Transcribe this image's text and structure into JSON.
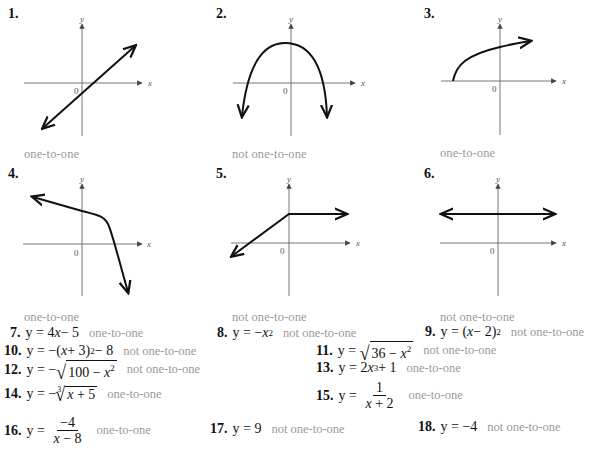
{
  "graphs": [
    {
      "number": "1.",
      "answer": "one-to-one",
      "curve": "line-increasing"
    },
    {
      "number": "2.",
      "answer": "not one-to-one",
      "curve": "downward-parabola"
    },
    {
      "number": "3.",
      "answer": "one-to-one",
      "curve": "square-root"
    },
    {
      "number": "4.",
      "answer": "one-to-one",
      "curve": "decreasing-bend"
    },
    {
      "number": "5.",
      "answer": "not one-to-one",
      "curve": "ramp-then-flat"
    },
    {
      "number": "6.",
      "answer": "not one-to-one",
      "curve": "horizontal-line"
    }
  ],
  "axes": {
    "x_label": "x",
    "y_label": "y",
    "origin_label": "0"
  },
  "equations": [
    {
      "number": "7.",
      "lhs": "y =",
      "expr": "4x − 5",
      "answer": "one-to-one"
    },
    {
      "number": "8.",
      "lhs": "y =",
      "expr": "−x²",
      "answer": "not one-to-one"
    },
    {
      "number": "9.",
      "lhs": "y =",
      "expr": "(x − 2)²",
      "answer": "not one-to-one"
    },
    {
      "number": "10.",
      "lhs": "y =",
      "expr": "−(x + 3)² − 8",
      "answer": "not one-to-one"
    },
    {
      "number": "11.",
      "lhs": "y =",
      "expr": "√(36 − x²)",
      "answer": "not one-to-one"
    },
    {
      "number": "12.",
      "lhs": "y =",
      "expr": "−√(100 − x²)",
      "answer": "not one-to-one"
    },
    {
      "number": "13.",
      "lhs": "y =",
      "expr": "2x³ + 1",
      "answer": "one-to-one"
    },
    {
      "number": "14.",
      "lhs": "y =",
      "expr": "−∛(x + 5)",
      "answer": "one-to-one"
    },
    {
      "number": "15.",
      "lhs": "y =",
      "expr": "1/(x + 2)",
      "answer": "one-to-one"
    },
    {
      "number": "16.",
      "lhs": "y =",
      "expr": "−4/(x − 8)",
      "answer": "one-to-one"
    },
    {
      "number": "17.",
      "lhs": "y =",
      "expr": "9",
      "answer": "not one-to-one"
    },
    {
      "number": "18.",
      "lhs": "y =",
      "expr": "−4",
      "answer": "not one-to-one"
    }
  ],
  "parts": {
    "e7": {
      "a": "4",
      "b": "x",
      "c": " − 5"
    },
    "e8": {
      "a": "−",
      "b": "x",
      "sup": "2"
    },
    "e9": {
      "a": "(",
      "b": "x",
      "c": " − 2)",
      "sup": "2"
    },
    "e10": {
      "a": "−(",
      "b": "x",
      "c": " + 3)",
      "sup": "2",
      "d": " − 8"
    },
    "e11": {
      "sign": "√",
      "a": "36 − ",
      "b": "x",
      "sup": "2"
    },
    "e12": {
      "neg": "−",
      "sign": "√",
      "a": "100 − ",
      "b": "x",
      "sup": "2"
    },
    "e13": {
      "a": "2",
      "b": "x",
      "sup": "3",
      "c": " + 1"
    },
    "e14": {
      "neg": "−",
      "idx": "3",
      "sign": "√",
      "b": "x",
      "c": " + 5"
    },
    "e15": {
      "top": "1",
      "b": "x",
      "c": " + 2"
    },
    "e16": {
      "top": "−4",
      "b": "x",
      "c": " − 8"
    },
    "e17": {
      "a": "9"
    },
    "e18": {
      "a": "−4"
    }
  },
  "colors": {
    "ink": "#111111",
    "answer_gray": "#9a9a9a",
    "axis_gray": "#666666"
  }
}
